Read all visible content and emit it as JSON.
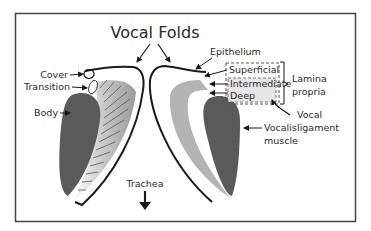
{
  "title": "Vocal Folds",
  "colors": {
    "outline": "#1a1a1a",
    "muscle": "#5a5a5a",
    "lamina_light": "#b4b4b4",
    "lamina_band": "#d0d0d0",
    "box_fill": "#e6e6e6",
    "frame": "#444444",
    "text": "#2a2a2a"
  },
  "labels": {
    "left": {
      "cover": "Cover",
      "transition": "Transition",
      "body": "Body"
    },
    "right": {
      "epithelium": "Epithelium",
      "superficial": "Superficial",
      "intermediate": "Intermediate",
      "deep": "Deep",
      "lamina_line1": "Lamina",
      "lamina_line2": "propria",
      "vocal_ligament_line1": "Vocal",
      "vocal_ligament_line2": "ligament",
      "vocalis_line1": "Vocalis",
      "vocalis_line2": "muscle"
    },
    "trachea": "Trachea"
  },
  "icons": {
    "trachea_arrow": "arrow-down-icon",
    "pointer_arrows": "arrow-icon"
  }
}
